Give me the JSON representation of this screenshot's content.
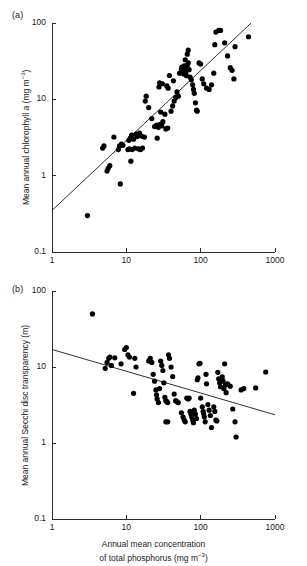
{
  "figure": {
    "panel_a_label": "(a)",
    "panel_b_label": "(b)",
    "xlabel_line1": "Annual mean concentration",
    "xlabel_line2_pre": "of total phosphorus (mg m",
    "xlabel_line2_sup": "−3",
    "xlabel_line2_post": ")",
    "ylabel_a_pre": "Mean annual chlorophyll ",
    "ylabel_a_ital": "a",
    "ylabel_a_mid": " (mg m",
    "ylabel_a_sup": "−3",
    "ylabel_a_post": ")",
    "ylabel_b": "Mean annual Secchi disc transparency (m)",
    "xticks": [
      "1",
      "10",
      "100",
      "1000"
    ],
    "yticks_a": [
      "100",
      "10",
      "1",
      "0.1"
    ],
    "yticks_b": [
      "100",
      "10",
      "1",
      "0.1"
    ],
    "point_color": "#000000",
    "line_color": "#1a1a1a",
    "axis_color": "#2b2b2b"
  },
  "chart_data": [
    {
      "type": "scatter",
      "panel": "(a)",
      "title": "",
      "xlabel": "Annual mean concentration of total phosphorus (mg m-3)",
      "ylabel": "Mean annual chlorophyll a (mg m-3)",
      "xscale": "log",
      "yscale": "log",
      "xlim": [
        1,
        1000
      ],
      "ylim": [
        0.1,
        100
      ],
      "xticks": [
        1,
        10,
        100,
        1000
      ],
      "yticks": [
        0.1,
        1,
        10,
        100
      ],
      "grid": false,
      "legend": "none",
      "fit_line": {
        "label": "regression line",
        "x": [
          1,
          530
        ],
        "y": [
          0.35,
          110
        ]
      },
      "points": [
        [
          3.0,
          0.3
        ],
        [
          8.3,
          0.78
        ],
        [
          5.5,
          1.15
        ],
        [
          5.7,
          1.25
        ],
        [
          6.0,
          1.35
        ],
        [
          11.5,
          1.55
        ],
        [
          4.8,
          2.3
        ],
        [
          5.0,
          2.45
        ],
        [
          7.8,
          2.2
        ],
        [
          8.1,
          2.45
        ],
        [
          8.6,
          2.6
        ],
        [
          9.0,
          2.5
        ],
        [
          10.5,
          2.2
        ],
        [
          11.0,
          2.25
        ],
        [
          12.0,
          2.2
        ],
        [
          13.0,
          2.3
        ],
        [
          14.5,
          2.25
        ],
        [
          15.5,
          2.2
        ],
        [
          16.5,
          2.3
        ],
        [
          6.8,
          3.2
        ],
        [
          10.8,
          2.9
        ],
        [
          11.3,
          3.1
        ],
        [
          11.8,
          3.4
        ],
        [
          12.5,
          3.0
        ],
        [
          13.5,
          3.5
        ],
        [
          14.0,
          3.25
        ],
        [
          15.0,
          3.6
        ],
        [
          16.0,
          3.3
        ],
        [
          17.5,
          3.2
        ],
        [
          26.0,
          3.1
        ],
        [
          24.0,
          4.4
        ],
        [
          25.5,
          4.6
        ],
        [
          27.0,
          4.3
        ],
        [
          28.5,
          4.7
        ],
        [
          30.0,
          4.5
        ],
        [
          22.0,
          5.6
        ],
        [
          31.0,
          5.1
        ],
        [
          34.0,
          4.1
        ],
        [
          36.0,
          4.2
        ],
        [
          18.0,
          9.5
        ],
        [
          18.5,
          11.0
        ],
        [
          20.0,
          7.8
        ],
        [
          29.0,
          6.8
        ],
        [
          33.0,
          6.4
        ],
        [
          40.0,
          7.0
        ],
        [
          42.0,
          8.2
        ],
        [
          44.0,
          9.5
        ],
        [
          46.0,
          10.5
        ],
        [
          48.0,
          12.5
        ],
        [
          50.0,
          11.0
        ],
        [
          27.5,
          14.5
        ],
        [
          28.0,
          16.5
        ],
        [
          30.5,
          16.0
        ],
        [
          35.0,
          15.0
        ],
        [
          36.5,
          14.0
        ],
        [
          38.0,
          20.5
        ],
        [
          43.0,
          17.5
        ],
        [
          52.0,
          22.0
        ],
        [
          55.0,
          25.0
        ],
        [
          56.0,
          26.5
        ],
        [
          57.0,
          24.0
        ],
        [
          58.0,
          23.0
        ],
        [
          59.0,
          21.5
        ],
        [
          60.0,
          27.5
        ],
        [
          61.0,
          25.5
        ],
        [
          62.0,
          23.5
        ],
        [
          63.0,
          22.0
        ],
        [
          64.0,
          20.5
        ],
        [
          66.0,
          28.0
        ],
        [
          68.0,
          30.0
        ],
        [
          70.0,
          24.5
        ],
        [
          72.0,
          19.5
        ],
        [
          75.0,
          18.0
        ],
        [
          78.0,
          15.5
        ],
        [
          80.0,
          13.5
        ],
        [
          82.0,
          12.0
        ],
        [
          85.0,
          9.0
        ],
        [
          88.0,
          7.2
        ],
        [
          90.0,
          7.0
        ],
        [
          62.0,
          33.0
        ],
        [
          66.0,
          39.0
        ],
        [
          68.0,
          44.0
        ],
        [
          95.0,
          30.0
        ],
        [
          100.0,
          29.0
        ],
        [
          105.0,
          18.5
        ],
        [
          110.0,
          16.0
        ],
        [
          120.0,
          14.0
        ],
        [
          130.0,
          13.5
        ],
        [
          140.0,
          15.5
        ],
        [
          150.0,
          22.0
        ],
        [
          155.0,
          52.0
        ],
        [
          160.0,
          76.0
        ],
        [
          175.0,
          80.0
        ],
        [
          185.0,
          80.0
        ],
        [
          210.0,
          55.0
        ],
        [
          230.0,
          37.0
        ],
        [
          250.0,
          26.0
        ],
        [
          265.0,
          24.0
        ],
        [
          280.0,
          18.5
        ],
        [
          290.0,
          49.0
        ],
        [
          440.0,
          66.0
        ]
      ]
    },
    {
      "type": "scatter",
      "panel": "(b)",
      "title": "",
      "xlabel": "Annual mean concentration of total phosphorus (mg m-3)",
      "ylabel": "Mean annual Secchi disc transparency (m)",
      "xscale": "log",
      "yscale": "log",
      "xlim": [
        1,
        1000
      ],
      "ylim": [
        0.1,
        100
      ],
      "xticks": [
        1,
        10,
        100,
        1000
      ],
      "yticks": [
        0.1,
        1,
        10,
        100
      ],
      "grid": false,
      "legend": "none",
      "fit_line": {
        "label": "regression line",
        "x": [
          1,
          1000
        ],
        "y": [
          17.0,
          2.35
        ]
      },
      "points": [
        [
          3.5,
          50.0
        ],
        [
          5.2,
          9.6
        ],
        [
          5.5,
          11.5
        ],
        [
          5.8,
          13.0
        ],
        [
          6.0,
          13.5
        ],
        [
          6.3,
          10.5
        ],
        [
          7.0,
          13.2
        ],
        [
          8.5,
          11.0
        ],
        [
          9.5,
          17.0
        ],
        [
          10.0,
          18.0
        ],
        [
          10.5,
          14.5
        ],
        [
          11.0,
          13.5
        ],
        [
          12.5,
          4.5
        ],
        [
          13.0,
          13.0
        ],
        [
          13.5,
          10.0
        ],
        [
          20.0,
          12.0
        ],
        [
          21.0,
          13.0
        ],
        [
          22.0,
          11.5
        ],
        [
          23.0,
          8.0
        ],
        [
          24.0,
          6.5
        ],
        [
          25.0,
          5.0
        ],
        [
          25.5,
          4.3
        ],
        [
          26.0,
          3.8
        ],
        [
          27.0,
          3.4
        ],
        [
          28.0,
          5.2
        ],
        [
          29.0,
          12.0
        ],
        [
          30.0,
          10.5
        ],
        [
          31.0,
          9.0
        ],
        [
          32.0,
          6.2
        ],
        [
          33.0,
          4.0
        ],
        [
          34.0,
          3.6
        ],
        [
          35.0,
          3.5
        ],
        [
          36.0,
          3.4
        ],
        [
          34.0,
          1.9
        ],
        [
          36.0,
          1.9
        ],
        [
          37.0,
          14.5
        ],
        [
          38.0,
          13.0
        ],
        [
          40.0,
          10.0
        ],
        [
          42.0,
          7.5
        ],
        [
          44.0,
          4.4
        ],
        [
          46.0,
          3.6
        ],
        [
          48.0,
          3.5
        ],
        [
          50.0,
          3.4
        ],
        [
          55.0,
          2.5
        ],
        [
          58.0,
          2.2
        ],
        [
          60.0,
          2.0
        ],
        [
          62.0,
          1.9
        ],
        [
          65.0,
          3.9
        ],
        [
          68.0,
          3.8
        ],
        [
          70.0,
          3.9
        ],
        [
          72.0,
          2.6
        ],
        [
          74.0,
          2.4
        ],
        [
          76.0,
          2.2
        ],
        [
          78.0,
          2.0
        ],
        [
          80.0,
          1.85
        ],
        [
          82.0,
          2.7
        ],
        [
          85.0,
          2.4
        ],
        [
          88.0,
          2.1
        ],
        [
          90.0,
          6.8
        ],
        [
          92.0,
          7.2
        ],
        [
          95.0,
          11.0
        ],
        [
          98.0,
          11.2
        ],
        [
          100.0,
          3.9
        ],
        [
          105.0,
          3.0
        ],
        [
          108.0,
          2.6
        ],
        [
          110.0,
          2.4
        ],
        [
          112.0,
          2.2
        ],
        [
          115.0,
          1.9
        ],
        [
          118.0,
          8.0
        ],
        [
          120.0,
          6.0
        ],
        [
          125.0,
          3.2
        ],
        [
          130.0,
          2.7
        ],
        [
          135.0,
          2.3
        ],
        [
          140.0,
          1.6
        ],
        [
          150.0,
          3.0
        ],
        [
          155.0,
          2.6
        ],
        [
          160.0,
          2.0
        ],
        [
          165.0,
          1.95
        ],
        [
          170.0,
          8.5
        ],
        [
          175.0,
          7.0
        ],
        [
          180.0,
          6.2
        ],
        [
          185.0,
          5.5
        ],
        [
          190.0,
          6.8
        ],
        [
          195.0,
          7.4
        ],
        [
          200.0,
          6.5
        ],
        [
          205.0,
          5.2
        ],
        [
          210.0,
          11.0
        ],
        [
          215.0,
          5.8
        ],
        [
          220.0,
          4.6
        ],
        [
          230.0,
          6.0
        ],
        [
          250.0,
          5.6
        ],
        [
          270.0,
          2.8
        ],
        [
          290.0,
          1.9
        ],
        [
          300.0,
          1.2
        ],
        [
          350.0,
          5.0
        ],
        [
          380.0,
          5.2
        ],
        [
          550.0,
          5.3
        ],
        [
          750.0,
          8.6
        ]
      ]
    }
  ]
}
